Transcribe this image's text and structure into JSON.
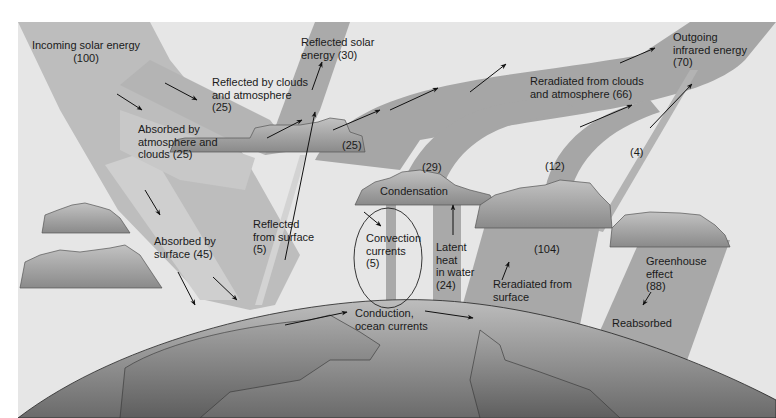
{
  "colors": {
    "background": "#e4e4e4",
    "band": "#a9a9a9",
    "band_light": "#c4c4c4",
    "cloud_top": "#bdbdbd",
    "cloud_bottom": "#8c8c8c",
    "earth_top": "#b5b5b5",
    "earth_bottom": "#6f6f6f",
    "arrow": "#111111"
  },
  "labels": {
    "incoming": "Incoming solar energy\n(100)",
    "reflected_clouds": "Reflected by clouds\nand atmosphere\n(25)",
    "reflected_solar": "Reflected solar\nenergy (30)",
    "absorbed_atmos": "Absorbed by\natmosphere and\nclouds (25)",
    "absorbed_surface": "Absorbed by\nsurface (45)",
    "reflected_surface": "Reflected\nfrom surface\n(5)",
    "flow_25": "(25)",
    "flow_29": "(29)",
    "flow_12": "(12)",
    "flow_4": "(4)",
    "condensation": "Condensation",
    "convection": "Convection\ncurrents\n(5)",
    "latent": "Latent\nheat\nin water\n(24)",
    "surface_104": "(104)",
    "reradiated_surface": "Reradiated from\nsurface",
    "reradiated_clouds": "Reradiated from clouds\nand atmosphere (66)",
    "outgoing": "Outgoing\ninfrared energy\n(70)",
    "greenhouse": "Greenhouse\neffect\n(88)",
    "reabsorbed": "Reabsorbed",
    "conduction": "Conduction,\nocean currents"
  },
  "flows": [
    {
      "name": "Incoming solar energy",
      "value": 100
    },
    {
      "name": "Reflected by clouds and atmosphere",
      "value": 25
    },
    {
      "name": "Reflected from surface",
      "value": 5
    },
    {
      "name": "Reflected solar energy",
      "value": 30
    },
    {
      "name": "Absorbed by atmosphere and clouds",
      "value": 25
    },
    {
      "name": "Absorbed by surface",
      "value": 45
    },
    {
      "name": "Convection currents",
      "value": 5
    },
    {
      "name": "Latent heat in water",
      "value": 24
    },
    {
      "name": "Reradiated from surface",
      "value": 104
    },
    {
      "name": "Greenhouse effect",
      "value": 88
    },
    {
      "name": "Reradiated from clouds and atmosphere",
      "value": 66
    },
    {
      "name": "Outgoing infrared energy",
      "value": 70
    },
    {
      "name": "Atmosphere to space flow A",
      "value": 25
    },
    {
      "name": "Atmosphere to space flow B",
      "value": 29
    },
    {
      "name": "Atmosphere to space flow C",
      "value": 12
    },
    {
      "name": "Surface window to space",
      "value": 4
    }
  ]
}
